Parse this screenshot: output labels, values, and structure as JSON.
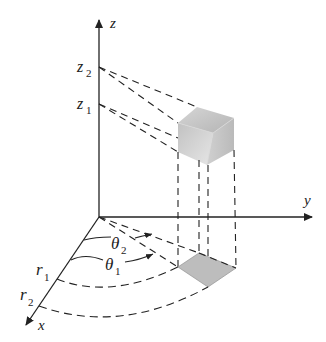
{
  "diagram": {
    "axes": {
      "z": {
        "label": "z"
      },
      "y": {
        "label": "y"
      },
      "x": {
        "label": "x"
      }
    },
    "z_ticks": [
      {
        "base": "z",
        "sub": "2"
      },
      {
        "base": "z",
        "sub": "1"
      }
    ],
    "angles": [
      {
        "base": "θ",
        "sub": "2"
      },
      {
        "base": "θ",
        "sub": "1"
      }
    ],
    "radii": [
      {
        "base": "r",
        "sub": "1"
      },
      {
        "base": "r",
        "sub": "2"
      }
    ],
    "colors": {
      "line": "#222222",
      "base_region": "#bdbdbd",
      "solid_light": "#e2e2e2",
      "solid_dark": "#a8a8a8"
    }
  }
}
